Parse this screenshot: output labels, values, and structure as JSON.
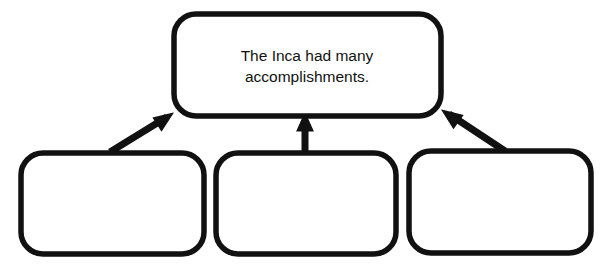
{
  "diagram": {
    "type": "hierarchy-graphic-organizer",
    "title_node": {
      "name": "main-idea-box",
      "lines": [
        "The Inca had many",
        "accomplishments."
      ],
      "text": "The Inca had many accomplishments.",
      "filled": false
    },
    "detail_nodes": [
      {
        "name": "detail-box-left",
        "text": "",
        "filled": false
      },
      {
        "name": "detail-box-middle",
        "text": "",
        "filled": false
      },
      {
        "name": "detail-box-right",
        "text": "",
        "filled": false
      }
    ],
    "connectors": [
      {
        "name": "arrow-left-to-main",
        "direction": "up-right"
      },
      {
        "name": "arrow-middle-to-main",
        "direction": "up"
      },
      {
        "name": "arrow-right-to-main",
        "direction": "up-left"
      }
    ],
    "colors": {
      "stroke": "#111111",
      "fill": "#ffffff",
      "text": "#111111",
      "background": "#ffffff"
    },
    "stroke_width": 5
  }
}
